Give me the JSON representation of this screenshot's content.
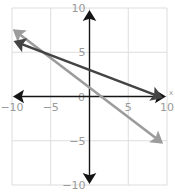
{
  "chart_data": {
    "type": "line",
    "title": "",
    "xlabel": "x",
    "ylabel": "",
    "xlim": [
      -10,
      10
    ],
    "ylim": [
      -10,
      10
    ],
    "grid": true,
    "x_ticks": [
      -10,
      -5,
      0,
      5,
      10
    ],
    "y_ticks": [
      -10,
      -5,
      0,
      5,
      10
    ],
    "tick_labels": {
      "x": [
        "−10",
        "−5",
        "0",
        "5",
        "10"
      ],
      "y": [
        "10",
        "5",
        "0",
        "−5",
        "−10"
      ]
    },
    "series": [
      {
        "name": "line-dark",
        "equation": "y = -1/3 x + 3",
        "color": "#444444",
        "x": [
          -9.8,
          9.5
        ],
        "y": [
          6.27,
          -0.17
        ],
        "arrows": "both"
      },
      {
        "name": "line-light",
        "equation": "y = -2/3 x + 1",
        "color": "#9c9c9c",
        "x": [
          -9.9,
          9.5
        ],
        "y": [
          7.6,
          -5.33
        ],
        "arrows": "both"
      }
    ],
    "intersection": {
      "x": -6,
      "y": 5
    }
  },
  "colors": {
    "axis": "#151515",
    "grid": "#dddddd",
    "tick_label": "#9a9a9a"
  }
}
